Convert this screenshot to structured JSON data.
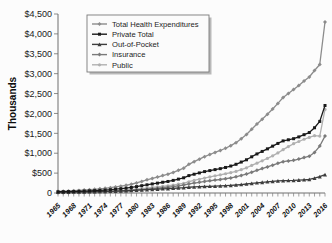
{
  "chart_data": {
    "type": "line",
    "title": "",
    "xlabel": "",
    "ylabel": "Thousands",
    "ylim": [
      0,
      4500
    ],
    "ytick_labels": [
      "$4,500",
      "$4,000",
      "$3,500",
      "$3,000",
      "$2,500",
      "$2,000",
      "$1,500",
      "$1,000",
      "$500",
      "0"
    ],
    "ytick_values": [
      4500,
      4000,
      3500,
      3000,
      2500,
      2000,
      1500,
      1000,
      500,
      0
    ],
    "grid": false,
    "legend_position": "top-left",
    "xtick_labels": [
      "1965",
      "1968",
      "1971",
      "1974",
      "1977",
      "1980",
      "1983",
      "1986",
      "1989",
      "1992",
      "1995",
      "1998",
      "2001",
      "2004",
      "2007",
      "2010",
      "2013",
      "2016"
    ],
    "x": [
      1965,
      1966,
      1967,
      1968,
      1969,
      1970,
      1971,
      1972,
      1973,
      1974,
      1975,
      1976,
      1977,
      1978,
      1979,
      1980,
      1981,
      1982,
      1983,
      1984,
      1985,
      1986,
      1987,
      1988,
      1989,
      1990,
      1991,
      1992,
      1993,
      1994,
      1995,
      1996,
      1997,
      1998,
      1999,
      2000,
      2001,
      2002,
      2003,
      2004,
      2005,
      2006,
      2007,
      2008,
      2009,
      2010,
      2011,
      2012,
      2013,
      2014,
      2015,
      2016
    ],
    "series": [
      {
        "name": "Total Health Expenditures",
        "color": "#8c8c8c",
        "marker": "diamond",
        "values": [
          42,
          46,
          52,
          58,
          65,
          74,
          83,
          93,
          104,
          117,
          133,
          152,
          172,
          194,
          220,
          253,
          291,
          330,
          366,
          402,
          439,
          473,
          518,
          571,
          625,
          721,
          788,
          851,
          914,
          968,
          1020,
          1069,
          1125,
          1190,
          1265,
          1365,
          1470,
          1604,
          1733,
          1855,
          1980,
          2113,
          2253,
          2400,
          2504,
          2604,
          2705,
          2817,
          2917,
          3080,
          3230,
          4300
        ]
      },
      {
        "name": "Private Total",
        "color": "#1a1a1a",
        "marker": "square",
        "values": [
          31,
          33,
          36,
          39,
          43,
          48,
          54,
          60,
          67,
          74,
          83,
          95,
          108,
          122,
          139,
          160,
          184,
          206,
          228,
          248,
          270,
          290,
          317,
          349,
          382,
          437,
          472,
          505,
          538,
          563,
          588,
          612,
          642,
          678,
          722,
          778,
          835,
          910,
          982,
          1045,
          1110,
          1178,
          1246,
          1310,
          1338,
          1365,
          1410,
          1466,
          1520,
          1640,
          1800,
          2200
        ]
      },
      {
        "name": "Out-of-Pocket",
        "color": "#3d3d3d",
        "marker": "triangle",
        "values": [
          21,
          22,
          23,
          25,
          27,
          29,
          32,
          34,
          37,
          40,
          43,
          47,
          52,
          57,
          63,
          70,
          78,
          85,
          92,
          98,
          105,
          110,
          118,
          126,
          134,
          145,
          152,
          158,
          164,
          168,
          172,
          177,
          183,
          191,
          201,
          213,
          226,
          241,
          256,
          268,
          281,
          292,
          304,
          311,
          313,
          316,
          324,
          332,
          340,
          372,
          410,
          460
        ]
      },
      {
        "name": "Insurance",
        "color": "#7a7a7a",
        "marker": "diamond",
        "values": [
          6,
          7,
          9,
          11,
          13,
          15,
          18,
          21,
          24,
          28,
          33,
          39,
          45,
          52,
          60,
          71,
          84,
          96,
          108,
          120,
          133,
          145,
          161,
          180,
          199,
          229,
          249,
          269,
          290,
          308,
          325,
          340,
          358,
          380,
          406,
          441,
          477,
          524,
          570,
          613,
          655,
          700,
          745,
          786,
          805,
          822,
          853,
          890,
          925,
          1020,
          1180,
          1430
        ]
      },
      {
        "name": "Public",
        "color": "#b0b0b0",
        "marker": "circle",
        "values": [
          10,
          13,
          17,
          20,
          23,
          27,
          30,
          34,
          38,
          43,
          50,
          58,
          66,
          74,
          84,
          96,
          110,
          124,
          139,
          153,
          168,
          182,
          200,
          221,
          243,
          283,
          315,
          346,
          376,
          405,
          432,
          457,
          484,
          512,
          543,
          586,
          634,
          694,
          751,
          810,
          870,
          935,
          1007,
          1090,
          1166,
          1239,
          1295,
          1351,
          1397,
          1440,
          1430,
          2100
        ]
      }
    ]
  }
}
